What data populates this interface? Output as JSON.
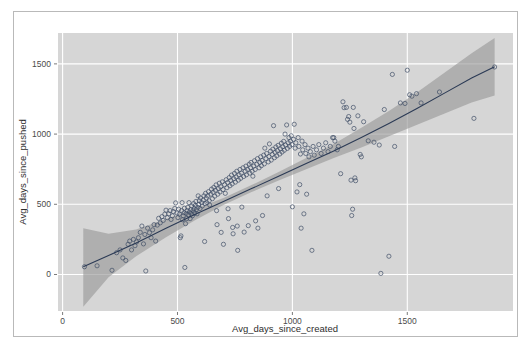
{
  "figure": {
    "background_color": "#ffffff",
    "frame_border_color": "#b9b9b9"
  },
  "chart_data": {
    "type": "scatter",
    "title": "",
    "subtitle": "",
    "xlabel": "Avg_days_since_created",
    "ylabel": "Avg_days_since_pushed",
    "xlim": [
      -20,
      1960
    ],
    "ylim": [
      -260,
      1720
    ],
    "xticks": [
      0,
      500,
      1000,
      1500
    ],
    "yticks": [
      0,
      500,
      1000,
      1500
    ],
    "xticklabels": [
      "0",
      "500",
      "1000",
      "1500"
    ],
    "yticklabels": [
      "0",
      "500",
      "1000",
      "1500"
    ],
    "grid": true,
    "grid_color": "#ffffff",
    "panel_background": "#d6d6d6",
    "legend": "none",
    "point_style": {
      "marker": "open-circle",
      "edge_color": "#3c4a63",
      "fill": "none",
      "radius": 2.1,
      "stroke_width": 0.8
    },
    "smooth_line": {
      "name": "loess smooth",
      "color": "#2b3a55",
      "width": 1.1,
      "ribbon_color": "#9a9a9a",
      "ribbon_opacity": 0.65,
      "x": [
        90,
        200,
        320,
        450,
        580,
        700,
        820,
        940,
        1060,
        1180,
        1300,
        1420,
        1540,
        1660,
        1780,
        1880
      ],
      "y": [
        55,
        135,
        225,
        330,
        430,
        520,
        610,
        700,
        790,
        880,
        975,
        1075,
        1180,
        1290,
        1400,
        1480
      ],
      "ylower": [
        -230,
        -20,
        130,
        265,
        390,
        495,
        585,
        670,
        750,
        830,
        905,
        985,
        1065,
        1145,
        1225,
        1275
      ],
      "yupper": [
        330,
        290,
        320,
        395,
        470,
        545,
        635,
        730,
        830,
        930,
        1045,
        1165,
        1295,
        1435,
        1575,
        1685
      ]
    },
    "series": [
      {
        "name": "repositories",
        "points": [
          [
            95,
            55
          ],
          [
            150,
            62
          ],
          [
            215,
            30
          ],
          [
            235,
            155
          ],
          [
            250,
            175
          ],
          [
            262,
            118
          ],
          [
            275,
            100
          ],
          [
            285,
            215
          ],
          [
            292,
            238
          ],
          [
            300,
            175
          ],
          [
            308,
            250
          ],
          [
            315,
            205
          ],
          [
            322,
            232
          ],
          [
            330,
            262
          ],
          [
            338,
            300
          ],
          [
            345,
            345
          ],
          [
            352,
            218
          ],
          [
            358,
            285
          ],
          [
            362,
            25
          ],
          [
            370,
            330
          ],
          [
            378,
            298
          ],
          [
            385,
            262
          ],
          [
            392,
            318
          ],
          [
            398,
            355
          ],
          [
            405,
            238
          ],
          [
            412,
            352
          ],
          [
            418,
            400
          ],
          [
            425,
            368
          ],
          [
            432,
            412
          ],
          [
            438,
            385
          ],
          [
            445,
            430
          ],
          [
            450,
            458
          ],
          [
            456,
            405
          ],
          [
            462,
            432
          ],
          [
            468,
            455
          ],
          [
            472,
            392
          ],
          [
            478,
            418
          ],
          [
            482,
            448
          ],
          [
            488,
            470
          ],
          [
            492,
            510
          ],
          [
            498,
            438
          ],
          [
            502,
            405
          ],
          [
            505,
            465
          ],
          [
            508,
            430
          ],
          [
            512,
            262
          ],
          [
            515,
            275
          ],
          [
            518,
            455
          ],
          [
            520,
            512
          ],
          [
            522,
            390
          ],
          [
            525,
            418
          ],
          [
            528,
            440
          ],
          [
            530,
            472
          ],
          [
            532,
            50
          ],
          [
            535,
            362
          ],
          [
            538,
            435
          ],
          [
            540,
            398
          ],
          [
            542,
            455
          ],
          [
            545,
            478
          ],
          [
            548,
            425
          ],
          [
            550,
            512
          ],
          [
            552,
            445
          ],
          [
            555,
            398
          ],
          [
            558,
            462
          ],
          [
            560,
            432
          ],
          [
            562,
            488
          ],
          [
            565,
            418
          ],
          [
            568,
            455
          ],
          [
            570,
            505
          ],
          [
            572,
            470
          ],
          [
            575,
            438
          ],
          [
            578,
            492
          ],
          [
            580,
            520
          ],
          [
            582,
            462
          ],
          [
            585,
            432
          ],
          [
            588,
            478
          ],
          [
            590,
            560
          ],
          [
            592,
            498
          ],
          [
            595,
            525
          ],
          [
            598,
            470
          ],
          [
            600,
            545
          ],
          [
            605,
            512
          ],
          [
            608,
            488
          ],
          [
            612,
            530
          ],
          [
            615,
            560
          ],
          [
            618,
            235
          ],
          [
            620,
            505
          ],
          [
            622,
            578
          ],
          [
            625,
            545
          ],
          [
            628,
            512
          ],
          [
            632,
            560
          ],
          [
            635,
            590
          ],
          [
            638,
            525
          ],
          [
            640,
            495
          ],
          [
            645,
            572
          ],
          [
            648,
            608
          ],
          [
            652,
            540
          ],
          [
            655,
            585
          ],
          [
            658,
            620
          ],
          [
            662,
            558
          ],
          [
            665,
            600
          ],
          [
            668,
            638
          ],
          [
            670,
            455
          ],
          [
            672,
            355
          ],
          [
            675,
            572
          ],
          [
            678,
            612
          ],
          [
            682,
            650
          ],
          [
            685,
            588
          ],
          [
            688,
            625
          ],
          [
            690,
            300
          ],
          [
            695,
            660
          ],
          [
            698,
            605
          ],
          [
            700,
            215
          ],
          [
            705,
            640
          ],
          [
            708,
            578
          ],
          [
            712,
            675
          ],
          [
            715,
            618
          ],
          [
            718,
            655
          ],
          [
            720,
            468
          ],
          [
            722,
            398
          ],
          [
            725,
            690
          ],
          [
            728,
            632
          ],
          [
            732,
            670
          ],
          [
            735,
            708
          ],
          [
            738,
            645
          ],
          [
            740,
            335
          ],
          [
            742,
            290
          ],
          [
            745,
            682
          ],
          [
            748,
            720
          ],
          [
            752,
            658
          ],
          [
            755,
            695
          ],
          [
            758,
            735
          ],
          [
            760,
            345
          ],
          [
            762,
            172
          ],
          [
            765,
            672
          ],
          [
            768,
            710
          ],
          [
            772,
            748
          ],
          [
            775,
            685
          ],
          [
            778,
            722
          ],
          [
            780,
            480
          ],
          [
            785,
            760
          ],
          [
            788,
            698
          ],
          [
            790,
            302
          ],
          [
            795,
            735
          ],
          [
            798,
            772
          ],
          [
            800,
            710
          ],
          [
            805,
            748
          ],
          [
            808,
            348
          ],
          [
            812,
            785
          ],
          [
            815,
            722
          ],
          [
            818,
            760
          ],
          [
            820,
            798
          ],
          [
            825,
            735
          ],
          [
            828,
            700
          ],
          [
            832,
            772
          ],
          [
            835,
            810
          ],
          [
            838,
            748
          ],
          [
            840,
            382
          ],
          [
            845,
            785
          ],
          [
            848,
            825
          ],
          [
            850,
            330
          ],
          [
            855,
            760
          ],
          [
            858,
            798
          ],
          [
            862,
            838
          ],
          [
            865,
            775
          ],
          [
            868,
            812
          ],
          [
            870,
            420
          ],
          [
            875,
            850
          ],
          [
            878,
            788
          ],
          [
            880,
            900
          ],
          [
            885,
            825
          ],
          [
            888,
            862
          ],
          [
            890,
            560
          ],
          [
            895,
            802
          ],
          [
            898,
            840
          ],
          [
            900,
            930
          ],
          [
            905,
            878
          ],
          [
            908,
            815
          ],
          [
            912,
            855
          ],
          [
            915,
            892
          ],
          [
            918,
            1060
          ],
          [
            922,
            832
          ],
          [
            925,
            870
          ],
          [
            928,
            908
          ],
          [
            932,
            845
          ],
          [
            935,
            882
          ],
          [
            938,
            920
          ],
          [
            940,
            612
          ],
          [
            945,
            858
          ],
          [
            948,
            895
          ],
          [
            952,
            935
          ],
          [
            955,
            872
          ],
          [
            958,
            910
          ],
          [
            962,
            948
          ],
          [
            965,
            885
          ],
          [
            968,
            1000
          ],
          [
            970,
            922
          ],
          [
            975,
            1065
          ],
          [
            978,
            898
          ],
          [
            982,
            938
          ],
          [
            985,
            975
          ],
          [
            988,
            912
          ],
          [
            992,
            950
          ],
          [
            995,
            988
          ],
          [
            998,
            925
          ],
          [
            1000,
            482
          ],
          [
            1005,
            962
          ],
          [
            1008,
            1070
          ],
          [
            1012,
            900
          ],
          [
            1015,
            938
          ],
          [
            1020,
            588
          ],
          [
            1025,
            975
          ],
          [
            1028,
            912
          ],
          [
            1032,
            640
          ],
          [
            1035,
            858
          ],
          [
            1038,
            330
          ],
          [
            1042,
            950
          ],
          [
            1045,
            888
          ],
          [
            1050,
            432
          ],
          [
            1055,
            925
          ],
          [
            1058,
            862
          ],
          [
            1062,
            572
          ],
          [
            1068,
            900
          ],
          [
            1072,
            838
          ],
          [
            1078,
            875
          ],
          [
            1085,
            172
          ],
          [
            1090,
            912
          ],
          [
            1095,
            850
          ],
          [
            1105,
            888
          ],
          [
            1115,
            925
          ],
          [
            1125,
            862
          ],
          [
            1135,
            900
          ],
          [
            1145,
            938
          ],
          [
            1155,
            875
          ],
          [
            1165,
            912
          ],
          [
            1175,
            975
          ],
          [
            1180,
            975
          ],
          [
            1185,
            950
          ],
          [
            1195,
            888
          ],
          [
            1200,
            912
          ],
          [
            1210,
            718
          ],
          [
            1220,
            1230
          ],
          [
            1225,
            1188
          ],
          [
            1235,
            1190
          ],
          [
            1240,
            1105
          ],
          [
            1245,
            1125
          ],
          [
            1250,
            1085
          ],
          [
            1255,
            672
          ],
          [
            1258,
            420
          ],
          [
            1262,
            465
          ],
          [
            1265,
            1190
          ],
          [
            1268,
            1040
          ],
          [
            1272,
            688
          ],
          [
            1275,
            668
          ],
          [
            1285,
            1130
          ],
          [
            1295,
            855
          ],
          [
            1300,
            838
          ],
          [
            1310,
            1088
          ],
          [
            1330,
            952
          ],
          [
            1355,
            942
          ],
          [
            1378,
            922
          ],
          [
            1385,
            8
          ],
          [
            1400,
            1175
          ],
          [
            1420,
            130
          ],
          [
            1435,
            1425
          ],
          [
            1445,
            912
          ],
          [
            1470,
            1222
          ],
          [
            1490,
            1218
          ],
          [
            1500,
            1455
          ],
          [
            1510,
            1280
          ],
          [
            1520,
            1270
          ],
          [
            1540,
            1288
          ],
          [
            1560,
            1222
          ],
          [
            1640,
            1300
          ],
          [
            1790,
            1112
          ],
          [
            1880,
            1478
          ]
        ]
      }
    ]
  },
  "axes": {
    "x_tick_0": "0",
    "x_tick_1": "500",
    "x_tick_2": "1000",
    "x_tick_3": "1500",
    "y_tick_0": "0",
    "y_tick_1": "500",
    "y_tick_2": "1000",
    "y_tick_3": "1500"
  }
}
